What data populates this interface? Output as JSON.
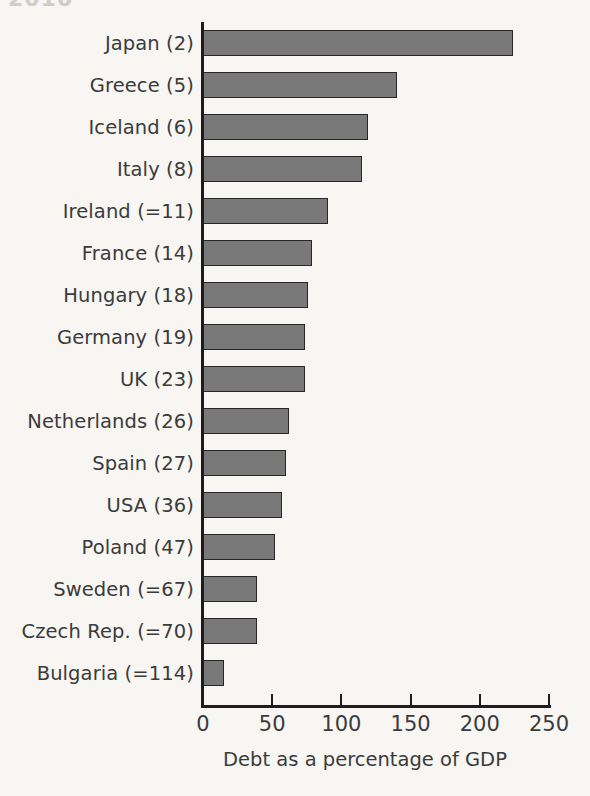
{
  "clipped_title": "2010",
  "chart_data": {
    "type": "bar",
    "orientation": "horizontal",
    "title": "",
    "xlabel": "Debt as a percentage of GDP",
    "ylabel": "",
    "xlim": [
      0,
      250
    ],
    "xticks": [
      0,
      50,
      100,
      150,
      200,
      250
    ],
    "xtick_labels": [
      "0",
      "50",
      "100",
      "150",
      "200",
      "250"
    ],
    "grid": false,
    "legend": null,
    "bar_color": "#797979",
    "bar_edge_color": "#272727",
    "background_color": "#f7f6f3",
    "text_color": "#3b3b3b",
    "categories": [
      "Japan (2)",
      "Greece (5)",
      "Iceland (6)",
      "Italy (8)",
      "Ireland (=11)",
      "France (14)",
      "Hungary (18)",
      "Germany (19)",
      "UK (23)",
      "Netherlands (26)",
      "Spain (27)",
      "USA (36)",
      "Poland (47)",
      "Sweden (=67)",
      "Czech Rep. (=70)",
      "Bulgaria (=114)"
    ],
    "values": [
      224,
      140,
      119,
      115,
      90,
      79,
      76,
      74,
      74,
      62,
      60,
      57,
      52,
      39,
      39,
      15
    ]
  }
}
